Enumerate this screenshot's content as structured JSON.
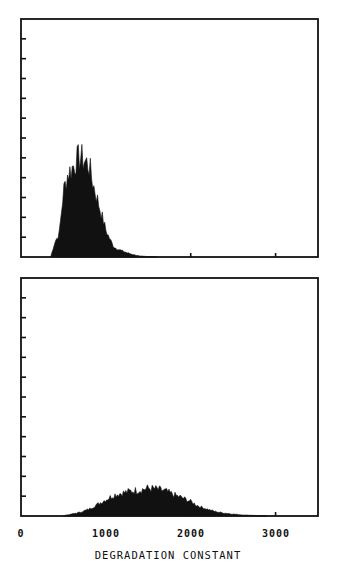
{
  "chart_data": [
    {
      "type": "area",
      "panel": "top",
      "title": "",
      "xlabel": "",
      "ylabel": "",
      "xlim": [
        0,
        3500
      ],
      "y_divisions": 12,
      "y_ticks_unlabeled": true,
      "x": [
        350,
        400,
        450,
        500,
        550,
        600,
        650,
        700,
        750,
        800,
        850,
        900,
        950,
        1000,
        1050,
        1100,
        1200,
        1300,
        1400,
        1500,
        1600
      ],
      "values": [
        0.0,
        0.8,
        1.2,
        3.4,
        4.3,
        4.6,
        5.0,
        5.2,
        5.0,
        4.8,
        3.8,
        3.0,
        2.2,
        1.4,
        0.9,
        0.5,
        0.3,
        0.15,
        0.05,
        0.02,
        0.0
      ],
      "notes": "Narrow right-skewed distribution peaking near 700"
    },
    {
      "type": "area",
      "panel": "bottom",
      "title": "",
      "xlabel": "DEGRADATION CONSTANT",
      "ylabel": "",
      "xlim": [
        0,
        3500
      ],
      "y_divisions": 12,
      "y_ticks_unlabeled": true,
      "x": [
        500,
        600,
        700,
        800,
        900,
        1000,
        1100,
        1200,
        1300,
        1400,
        1500,
        1600,
        1700,
        1800,
        1900,
        2000,
        2100,
        2200,
        2300,
        2400,
        2500,
        2600,
        2700,
        2800,
        2900
      ],
      "values": [
        0.02,
        0.1,
        0.2,
        0.35,
        0.6,
        0.85,
        1.1,
        1.2,
        1.3,
        1.35,
        1.45,
        1.4,
        1.3,
        1.1,
        0.95,
        0.75,
        0.5,
        0.35,
        0.22,
        0.15,
        0.1,
        0.06,
        0.04,
        0.02,
        0.0
      ],
      "notes": "Broad distribution peaking near 1500"
    }
  ],
  "x_axis": {
    "tick_labels": [
      "0",
      "1000",
      "2000",
      "3000"
    ],
    "tick_values": [
      0,
      1000,
      2000,
      3000
    ],
    "title": "DEGRADATION CONSTANT"
  },
  "colors": {
    "ink": "#111111",
    "background": "#ffffff"
  }
}
